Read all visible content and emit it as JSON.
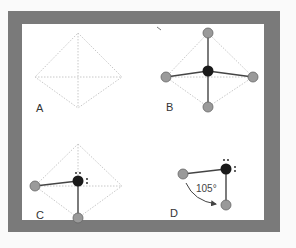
{
  "figure": {
    "frame_color": "#7a7a7a",
    "background": "#ffffff",
    "panels": [
      {
        "label": "A",
        "description": "empty tetrahedral outline (dotted)"
      },
      {
        "label": "B",
        "description": "central atom bonded to four substituents"
      },
      {
        "label": "C",
        "description": "central atom with two bonds and two lone pairs"
      },
      {
        "label": "D",
        "description": "bent molecule with bond angle"
      }
    ],
    "bond_angle": "105°",
    "colors": {
      "central_atom": "#1a1a1a",
      "substituent_atom": "#9a9a9a",
      "dotted_outline": "#c8c8c8",
      "bond": "#444444"
    }
  }
}
